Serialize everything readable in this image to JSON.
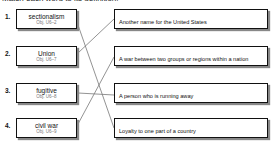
{
  "instructions": "Match each word to its definition.",
  "terms": [
    {
      "number": "1.",
      "word": "sectionalism",
      "objective": "Obj. U6–2"
    },
    {
      "number": "2.",
      "word": "Union",
      "objective": "Obj. U6–7"
    },
    {
      "number": "3.",
      "word": "fugitive",
      "objective": "Obj. U6–8"
    },
    {
      "number": "4.",
      "word": "civil war",
      "objective": "Obj. U6–9"
    }
  ],
  "definitions": [
    {
      "text": "Another name for the United States"
    },
    {
      "text": "A war between two groups or regions within a nation"
    },
    {
      "text": "A person who is running away"
    },
    {
      "text": "Loyalty to one part of a country"
    }
  ],
  "matches": [
    {
      "term": "sectionalism",
      "definition": "Loyalty to one part of a country"
    },
    {
      "term": "Union",
      "definition": "Another name for the United States"
    },
    {
      "term": "fugitive",
      "definition": "A person who is running away"
    },
    {
      "term": "civil war",
      "definition": "A war between two groups or regions within a nation"
    }
  ],
  "colors": {
    "line": "#777777",
    "border": "#111111",
    "shadow": "#888888"
  }
}
